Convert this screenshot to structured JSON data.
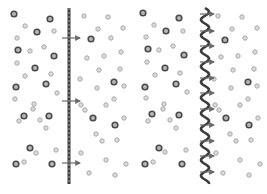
{
  "diagram": {
    "title": "",
    "colors": {
      "background": "#ffffff",
      "large_particle_stroke": "#4a4a4a",
      "large_particle_fill": "#b8b8b8",
      "small_particle_stroke": "#a8a8a8",
      "small_particle_fill": "#dcdcdc",
      "membrane": "#3c3c3c",
      "membrane_dash": "#8a8a8a",
      "arrow": "#6a6a6a"
    },
    "panels": [
      {
        "name": "flat-membrane-panel",
        "membrane": {
          "type": "straight-dashed",
          "x": 69,
          "y1": 8,
          "y2": 184
        },
        "arrows": [
          {
            "x1": 62,
            "x2": 80,
            "y": 38
          },
          {
            "x1": 62,
            "x2": 80,
            "y": 101
          },
          {
            "x1": 62,
            "x2": 80,
            "y": 163
          }
        ],
        "large_particles": [
          [
            14,
            14
          ],
          [
            50,
            19
          ],
          [
            37,
            32
          ],
          [
            18,
            50
          ],
          [
            54,
            56
          ],
          [
            35,
            68
          ],
          [
            46,
            84
          ],
          [
            16,
            87
          ],
          [
            24,
            116
          ],
          [
            49,
            116
          ],
          [
            30,
            148
          ],
          [
            16,
            164
          ],
          [
            52,
            164
          ],
          [
            91,
            39
          ],
          [
            114,
            82
          ],
          [
            93,
            118
          ],
          [
            115,
            125
          ]
        ],
        "small_particles": [
          [
            25,
            26
          ],
          [
            54,
            31
          ],
          [
            17,
            38
          ],
          [
            44,
            47
          ],
          [
            30,
            51
          ],
          [
            17,
            63
          ],
          [
            25,
            76
          ],
          [
            51,
            74
          ],
          [
            15,
            99
          ],
          [
            34,
            104
          ],
          [
            57,
            93
          ],
          [
            33,
            109
          ],
          [
            40,
            120
          ],
          [
            19,
            121
          ],
          [
            46,
            128
          ],
          [
            56,
            150
          ],
          [
            36,
            153
          ],
          [
            24,
            162
          ],
          [
            84,
            16
          ],
          [
            108,
            17
          ],
          [
            98,
            29
          ],
          [
            123,
            28
          ],
          [
            111,
            38
          ],
          [
            87,
            58
          ],
          [
            104,
            56
          ],
          [
            121,
            52
          ],
          [
            99,
            70
          ],
          [
            120,
            69
          ],
          [
            80,
            79
          ],
          [
            97,
            88
          ],
          [
            124,
            86
          ],
          [
            114,
            99
          ],
          [
            81,
            105
          ],
          [
            106,
            105
          ],
          [
            124,
            118
          ],
          [
            85,
            110
          ],
          [
            96,
            134
          ],
          [
            117,
            140
          ],
          [
            126,
            164
          ],
          [
            102,
            141
          ],
          [
            81,
            153
          ],
          [
            89,
            173
          ],
          [
            115,
            175
          ],
          [
            75,
            200
          ],
          [
            106,
            160
          ]
        ]
      },
      {
        "name": "wavy-membrane-panel",
        "membrane": {
          "type": "wavy",
          "x": 205,
          "y1": 8,
          "y2": 184,
          "amplitude": 4,
          "period": 15.6
        },
        "arrows": [
          {
            "x1": 200,
            "x2": 214,
            "y": 14
          },
          {
            "x1": 200,
            "x2": 214,
            "y": 31
          },
          {
            "x1": 200,
            "x2": 214,
            "y": 46
          },
          {
            "x1": 200,
            "x2": 214,
            "y": 62
          },
          {
            "x1": 200,
            "x2": 214,
            "y": 78
          },
          {
            "x1": 200,
            "x2": 214,
            "y": 93
          },
          {
            "x1": 200,
            "x2": 214,
            "y": 109
          },
          {
            "x1": 200,
            "x2": 214,
            "y": 125
          },
          {
            "x1": 200,
            "x2": 214,
            "y": 141
          },
          {
            "x1": 200,
            "x2": 214,
            "y": 156
          },
          {
            "x1": 200,
            "x2": 214,
            "y": 172
          }
        ],
        "large_particles": [
          [
            143,
            13
          ],
          [
            179,
            18
          ],
          [
            166,
            31
          ],
          [
            148,
            49
          ],
          [
            184,
            55
          ],
          [
            165,
            68
          ],
          [
            176,
            84
          ],
          [
            145,
            87
          ],
          [
            152,
            114
          ],
          [
            179,
            115
          ],
          [
            159,
            148
          ],
          [
            145,
            164
          ],
          [
            182,
            164
          ],
          [
            225,
            40
          ],
          [
            248,
            82
          ],
          [
            226,
            118
          ],
          [
            249,
            125
          ]
        ],
        "small_particles": [
          [
            154,
            25
          ],
          [
            183,
            31
          ],
          [
            146,
            37
          ],
          [
            173,
            46
          ],
          [
            159,
            50
          ],
          [
            147,
            62
          ],
          [
            155,
            75
          ],
          [
            180,
            73
          ],
          [
            146,
            98
          ],
          [
            164,
            104
          ],
          [
            187,
            92
          ],
          [
            163,
            109
          ],
          [
            170,
            120
          ],
          [
            148,
            121
          ],
          [
            176,
            128
          ],
          [
            186,
            150
          ],
          [
            165,
            152
          ],
          [
            153,
            162
          ],
          [
            218,
            16
          ],
          [
            242,
            17
          ],
          [
            232,
            29
          ],
          [
            257,
            28
          ],
          [
            245,
            38
          ],
          [
            221,
            57
          ],
          [
            238,
            56
          ],
          [
            255,
            52
          ],
          [
            233,
            70
          ],
          [
            254,
            69
          ],
          [
            214,
            79
          ],
          [
            231,
            88
          ],
          [
            257,
            86
          ],
          [
            248,
            99
          ],
          [
            215,
            105
          ],
          [
            240,
            105
          ],
          [
            258,
            118
          ],
          [
            219,
            110
          ],
          [
            230,
            134
          ],
          [
            251,
            140
          ],
          [
            260,
            164
          ],
          [
            236,
            141
          ],
          [
            216,
            153
          ],
          [
            223,
            173
          ],
          [
            249,
            175
          ],
          [
            240,
            160
          ]
        ]
      }
    ]
  }
}
